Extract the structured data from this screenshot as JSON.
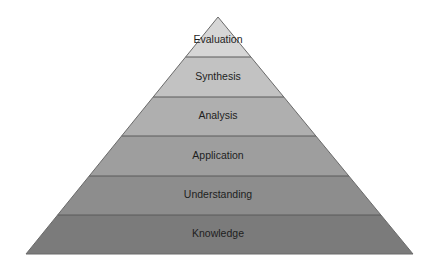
{
  "diagram": {
    "type": "pyramid",
    "apex": [
      218,
      17
    ],
    "base_left": [
      26,
      254
    ],
    "base_right": [
      413,
      254
    ],
    "divider_color": "#5a5a5a",
    "outline_color": "#6a6a6a",
    "levels": [
      {
        "label": "Evaluation",
        "y_top": 17,
        "y_bottom": 57,
        "fill": "#d6d6d6"
      },
      {
        "label": "Synthesis",
        "y_top": 57,
        "y_bottom": 97,
        "fill": "#c2c2c2"
      },
      {
        "label": "Analysis",
        "y_top": 97,
        "y_bottom": 136,
        "fill": "#afafaf"
      },
      {
        "label": "Application",
        "y_top": 136,
        "y_bottom": 176,
        "fill": "#9e9e9e"
      },
      {
        "label": "Understanding",
        "y_top": 176,
        "y_bottom": 215,
        "fill": "#8d8d8d"
      },
      {
        "label": "Knowledge",
        "y_top": 215,
        "y_bottom": 254,
        "fill": "#7b7b7b"
      }
    ]
  }
}
